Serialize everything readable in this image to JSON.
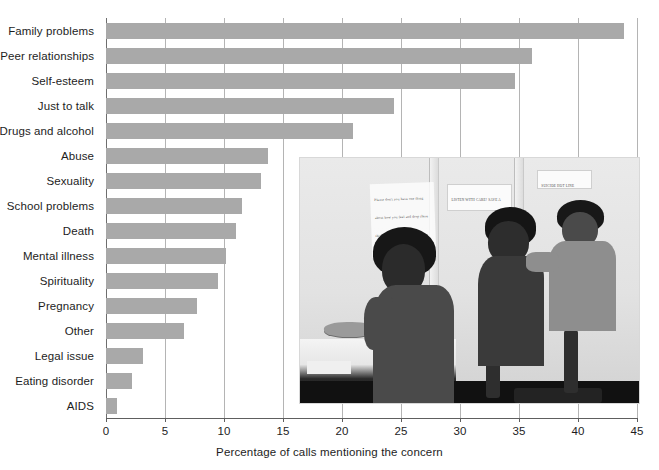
{
  "chart_data": {
    "type": "bar",
    "orientation": "horizontal",
    "title": "",
    "xlabel": "Percentage of calls mentioning the concern",
    "ylabel": "",
    "xlim": [
      0,
      45
    ],
    "xticks": [
      0,
      5,
      10,
      15,
      20,
      25,
      30,
      35,
      40,
      45
    ],
    "grid": "vertical",
    "legend": null,
    "bar_color": "#a9a9a9",
    "categories": [
      "Family problems",
      "Peer relationships",
      "Self-esteem",
      "Just to talk",
      "Drugs and alcohol",
      "Abuse",
      "Sexuality",
      "School problems",
      "Death",
      "Mental illness",
      "Spirituality",
      "Pregnancy",
      "Other",
      "Legal issue",
      "Eating disorder",
      "AIDS"
    ],
    "values": [
      43.9,
      36.1,
      34.7,
      24.4,
      20.9,
      13.7,
      13.1,
      11.5,
      11.0,
      10.2,
      9.5,
      7.7,
      6.6,
      3.1,
      2.2,
      0.9
    ]
  },
  "axis": {
    "x_title": "Percentage of calls mentioning the concern",
    "tick_labels": [
      "0",
      "5",
      "10",
      "15",
      "20",
      "25",
      "30",
      "35",
      "40",
      "45"
    ]
  },
  "photo": {
    "caption": "",
    "description": "Black and white photograph of three teenage peer counselors seated at a phone hotline bank of cubicle partitions",
    "notes": [
      {
        "id": "note-left",
        "text": "Please don't you have one thing about how you feel and drop these things you need help"
      },
      {
        "id": "note-middle",
        "text": "LISTEN WITH CARE! SAVE A LIFE!"
      },
      {
        "id": "note-right",
        "text": "SUICIDE HOT LINE"
      }
    ]
  },
  "colors": {
    "bar": "#a9a9a9",
    "gridline": "#b4b4b4",
    "axis": "#5e5e5e",
    "text": "#1d1d1d",
    "background": "#ffffff"
  }
}
